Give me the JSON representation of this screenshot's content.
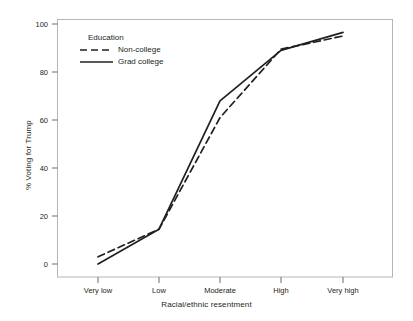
{
  "chart_data": {
    "type": "line",
    "title": "",
    "xlabel": "Racial/ethnic resentment",
    "ylabel": "% Voting for Trump",
    "categories": [
      "Very low",
      "Low",
      "Moderate",
      "High",
      "Very high"
    ],
    "ylim": [
      -4,
      104
    ],
    "yticks": [
      0,
      20,
      40,
      60,
      80,
      100
    ],
    "ytick_labels": [
      "0",
      "20",
      "40",
      "60",
      "80",
      "100"
    ],
    "grid": false,
    "legend_position": "upper-left-inside",
    "legend_title": "Education",
    "series": [
      {
        "name": "Non-college",
        "style": "dashed",
        "color": "#231f20",
        "values": [
          3,
          14.5,
          61,
          89.5,
          95
        ]
      },
      {
        "name": "Grad college",
        "style": "solid",
        "color": "#231f20",
        "values": [
          0,
          14.5,
          68,
          89,
          96.5
        ]
      }
    ]
  },
  "axes": {
    "ylabel": "% Voting for Trump",
    "xlabel": "Racial/ethnic resentment",
    "ytick_labels": [
      "100",
      "80",
      "60",
      "40",
      "20",
      "0"
    ],
    "xtick_labels": [
      "Very low",
      "Low",
      "Moderate",
      "High",
      "Very high"
    ]
  },
  "legend": {
    "title": "Education",
    "entries": [
      {
        "label": "Non-college",
        "style": "dashed"
      },
      {
        "label": "Grad college",
        "style": "solid"
      }
    ]
  },
  "colors": {
    "line": "#231f20",
    "frame": "#b3b3b3",
    "text": "#231f20",
    "background": "#ffffff"
  }
}
